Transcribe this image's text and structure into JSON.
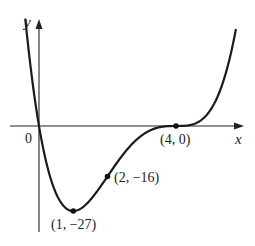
{
  "chart_data": {
    "type": "line",
    "title": "",
    "function": "y = x(x - 4)^3",
    "xlabel": "x",
    "ylabel": "y",
    "origin_label": "0",
    "xlim": [
      -0.85,
      5.95
    ],
    "ylim": [
      -33,
      33
    ],
    "grid": false,
    "legend": null,
    "x": [
      -0.38,
      -0.2,
      0,
      0.25,
      0.5,
      0.75,
      1,
      1.25,
      1.5,
      1.75,
      2,
      2.5,
      3,
      3.5,
      4,
      4.5,
      5,
      5.5,
      5.75
    ],
    "series": [
      {
        "name": "f(x)",
        "values": [
          31.9,
          11.0,
          0,
          -13.2,
          -21.4,
          -25.7,
          -27,
          -26.0,
          -23.4,
          -19.9,
          -16,
          -8.4,
          -3,
          -0.4,
          0,
          0.6,
          5,
          18.6,
          30.9
        ]
      }
    ],
    "annotations": [
      {
        "label": "(1, −27)",
        "x": 1,
        "y": -27
      },
      {
        "label": "(2, −16)",
        "x": 2,
        "y": -16
      },
      {
        "label": "(4, 0)",
        "x": 4,
        "y": 0
      }
    ]
  },
  "labels": {
    "y_axis": "y",
    "x_axis": "x",
    "origin": "0",
    "point_min": "(1, −27)",
    "point_inflection": "(2, −16)",
    "point_root": "(4, 0)"
  }
}
